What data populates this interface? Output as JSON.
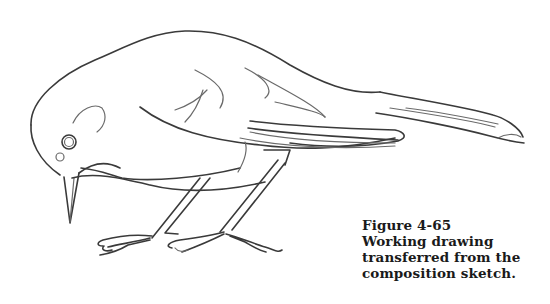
{
  "figure": {
    "caption": {
      "number": "Figure 4-65",
      "lines": [
        "Working drawing",
        "transferred from the",
        "composition sketch."
      ]
    }
  }
}
